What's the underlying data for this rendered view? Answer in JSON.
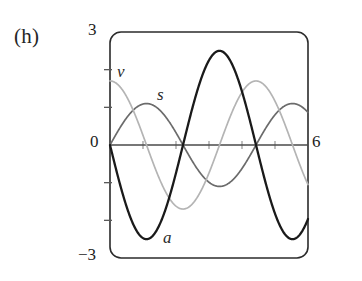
{
  "figure": {
    "panel_label": "(h)",
    "frame": {
      "style": "rounded-rectangle",
      "color": "#2b2b2b"
    }
  },
  "axes": {
    "y_max_label": "3",
    "y_min_label": "−3",
    "y_zero_label": "0",
    "x_max_label": "6",
    "x_min_value": 0,
    "x_max_value": 6,
    "y_min_value": -3,
    "y_max_value": 3,
    "x_ticks": [
      1,
      2,
      3,
      4,
      5
    ],
    "y_ticks": [
      2,
      1,
      -1,
      -2
    ],
    "axis_color": "#444444"
  },
  "curves": [
    {
      "label": "s",
      "color": "#6b6b6b",
      "width": 1.7
    },
    {
      "label": "v",
      "color": "#b4b4b4",
      "width": 1.7
    },
    {
      "label": "a",
      "color": "#1a1a1a",
      "width": 2.3
    }
  ],
  "chart_data": {
    "type": "line",
    "title": "",
    "xlabel": "",
    "ylabel": "",
    "xlim": [
      0,
      6
    ],
    "ylim": [
      -3,
      3
    ],
    "xticks": [
      0,
      1,
      2,
      3,
      4,
      5,
      6
    ],
    "xticklabels": [
      "0",
      "",
      "",
      "",
      "",
      "",
      "6"
    ],
    "yticks": [
      -3,
      -2,
      -1,
      0,
      1,
      2,
      3
    ],
    "yticklabels": [
      "−3",
      "",
      "",
      "0",
      "",
      "",
      "3"
    ],
    "grid": false,
    "legend": "inline-labels",
    "annotations": [
      {
        "text": "v",
        "x": 0.25,
        "y": 2.05
      },
      {
        "text": "s",
        "x": 1.55,
        "y": 1.45
      },
      {
        "text": "a",
        "x": 1.75,
        "y": -2.45
      },
      {
        "text": "(h)",
        "x": -2.9,
        "y": 2.6
      }
    ],
    "x": [
      0,
      0.25,
      0.5,
      0.75,
      1,
      1.25,
      1.5,
      1.75,
      2,
      2.25,
      2.5,
      2.75,
      3,
      3.25,
      3.5,
      3.75,
      4,
      4.25,
      4.5,
      4.75,
      5,
      5.25,
      5.5,
      5.75,
      6
    ],
    "series": [
      {
        "name": "s",
        "description": "position, s = 1.1 sin(1.42 t)",
        "amplitude": 1.1,
        "phase": 0,
        "values": [
          0,
          0.38,
          0.72,
          0.96,
          1.09,
          1.09,
          0.96,
          0.72,
          0.38,
          0.0,
          -0.38,
          -0.72,
          -0.96,
          -1.09,
          -1.09,
          -0.96,
          -0.72,
          -0.38,
          0.0,
          0.38,
          0.72,
          0.96,
          1.09,
          1.09,
          0.96
        ]
      },
      {
        "name": "v",
        "description": "velocity, v = 1.7 cos(1.42 t)",
        "amplitude": 1.7,
        "phase": 1.5708,
        "values": [
          1.7,
          1.59,
          1.28,
          0.81,
          0.24,
          -0.36,
          -0.9,
          -1.33,
          -1.6,
          -1.7,
          -1.6,
          -1.33,
          -0.9,
          -0.36,
          0.24,
          0.81,
          1.28,
          1.59,
          1.7,
          1.59,
          1.28,
          0.81,
          0.24,
          -0.36,
          -0.9
        ]
      },
      {
        "name": "a",
        "description": "acceleration, a = -2.5 sin(1.42 t)",
        "amplitude": 2.5,
        "phase": 3.14159,
        "values": [
          0,
          -0.87,
          -1.63,
          -2.18,
          -2.47,
          -2.47,
          -2.18,
          -1.63,
          -0.87,
          0.0,
          0.87,
          1.63,
          2.18,
          2.47,
          2.47,
          2.18,
          1.63,
          0.87,
          0.0,
          -0.87,
          -1.63,
          -2.18,
          -2.47,
          -2.47,
          -2.18
        ]
      }
    ]
  }
}
